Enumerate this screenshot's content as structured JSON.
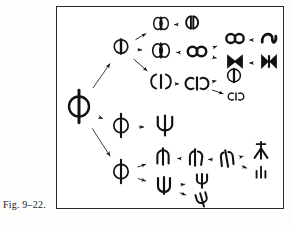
{
  "figure": {
    "caption": "Fig. 9–22.",
    "border_color": "#2a2a2a",
    "ink_color": "#121212",
    "background": "#ffffff",
    "box": {
      "x": 56,
      "y": 6,
      "width": 228,
      "height": 203
    }
  },
  "diagram": {
    "type": "branching-lineage-tree",
    "orientation": "left-to-right",
    "nodes": [
      {
        "id": "root",
        "name": "root-parent-form",
        "glyph": "phi-circle-bar",
        "label": "Φ",
        "x": 22,
        "y": 101,
        "size": 25
      },
      {
        "id": "n-top",
        "name": "upper-branch-parent",
        "glyph": "circle-vertical-bar",
        "label": "Ⓘ",
        "x": 64,
        "y": 41,
        "size": 17
      },
      {
        "id": "n-top-a1",
        "name": "upper-a-stage-1",
        "glyph": "double-lobe-capsule",
        "label": "◑◐",
        "x": 104,
        "y": 18,
        "size": 15
      },
      {
        "id": "n-top-a2",
        "name": "upper-a-stage-2",
        "glyph": "split-lobe-pair",
        "label": "◖◗",
        "x": 135,
        "y": 17,
        "size": 15
      },
      {
        "id": "n-top-b1",
        "name": "upper-b-stage-1",
        "glyph": "double-lobe-capsule",
        "label": "◑◐",
        "x": 104,
        "y": 45,
        "size": 17
      },
      {
        "id": "n-top-b2",
        "name": "upper-b-stage-2",
        "glyph": "double-circle-infinity",
        "label": "∞",
        "x": 140,
        "y": 46,
        "size": 18
      },
      {
        "id": "n-top-b3a",
        "name": "upper-b-branch-upper-infinity",
        "glyph": "double-circle-infinity",
        "label": "∞",
        "x": 178,
        "y": 33,
        "size": 17
      },
      {
        "id": "n-top-b3a2",
        "name": "upper-b-branch-upper-hook",
        "glyph": "s-hook-curve",
        "label": "ʅ",
        "x": 212,
        "y": 33,
        "size": 17
      },
      {
        "id": "n-top-b3b",
        "name": "upper-b-branch-lower-bowtie",
        "glyph": "bowtie",
        "label": "⋈",
        "x": 178,
        "y": 56,
        "size": 17
      },
      {
        "id": "n-top-b3b2",
        "name": "upper-b-branch-lower-bowtie-barred",
        "glyph": "bowtie-with-bar",
        "label": "⋈|",
        "x": 212,
        "y": 56,
        "size": 17
      },
      {
        "id": "n-top-c1",
        "name": "upper-c-stage-1",
        "glyph": "paren-bar-paren",
        "label": "(|)",
        "x": 104,
        "y": 76,
        "size": 16
      },
      {
        "id": "n-top-c2",
        "name": "upper-c-stage-2",
        "glyph": "c-bar-reversed-c",
        "label": "c|ɔ",
        "x": 140,
        "y": 78,
        "size": 16
      },
      {
        "id": "n-top-c3a",
        "name": "upper-c-branch-upper-circle-bar",
        "glyph": "circle-vertical-bar",
        "label": "ɸ",
        "x": 177,
        "y": 70,
        "size": 16
      },
      {
        "id": "n-top-c3b",
        "name": "upper-c-branch-lower-cic",
        "glyph": "c-i-reversed-c",
        "label": "cIƆ",
        "x": 179,
        "y": 91,
        "size": 11
      },
      {
        "id": "n-mid",
        "name": "middle-branch-parent",
        "glyph": "phi-circle-bar",
        "label": "Φ",
        "x": 64,
        "y": 120,
        "size": 18
      },
      {
        "id": "n-mid-2",
        "name": "middle-branch-psi",
        "glyph": "psi-trident",
        "label": "Ψ",
        "x": 108,
        "y": 120,
        "size": 19
      },
      {
        "id": "n-bot",
        "name": "lower-branch-parent",
        "glyph": "phi-circle-bar",
        "label": "Φ",
        "x": 64,
        "y": 166,
        "size": 18
      },
      {
        "id": "n-bot-a1",
        "name": "lower-a-stage-1",
        "glyph": "arch-with-bar",
        "label": "ɸ̄",
        "x": 106,
        "y": 151,
        "size": 16
      },
      {
        "id": "n-bot-a2",
        "name": "lower-a-stage-2",
        "glyph": "arch-splitting",
        "label": "ɗʱ",
        "x": 139,
        "y": 152,
        "size": 16
      },
      {
        "id": "n-bot-a3",
        "name": "lower-a-stage-3",
        "glyph": "arch-separated",
        "label": "ʃʅ",
        "x": 170,
        "y": 153,
        "size": 16
      },
      {
        "id": "n-bot-a4a",
        "name": "lower-a-branch-upper-sprout",
        "glyph": "upright-sprout",
        "label": "⋏",
        "x": 204,
        "y": 145,
        "size": 16
      },
      {
        "id": "n-bot-a4b",
        "name": "lower-a-branch-lower-cluster",
        "glyph": "small-cluster",
        "label": "ılı",
        "x": 204,
        "y": 167,
        "size": 13
      },
      {
        "id": "n-bot-b1",
        "name": "lower-b-stage-1",
        "glyph": "cup-with-bar",
        "label": "ψ",
        "x": 107,
        "y": 180,
        "size": 17
      },
      {
        "id": "n-bot-b2a",
        "name": "lower-b-branch-upper-psi",
        "glyph": "psi-small",
        "label": "ψ",
        "x": 145,
        "y": 175,
        "size": 15
      },
      {
        "id": "n-bot-b2b",
        "name": "lower-b-branch-lower-psi-tilted",
        "glyph": "psi-tilted",
        "label": "ψ",
        "x": 145,
        "y": 194,
        "size": 15
      }
    ],
    "arrows": [
      {
        "from": "root",
        "to": "n-top",
        "style": "long"
      },
      {
        "from": "root",
        "to": "n-mid",
        "style": "long"
      },
      {
        "from": "root",
        "to": "n-bot",
        "style": "long"
      },
      {
        "from": "n-top",
        "to": "n-top-a1",
        "style": "short"
      },
      {
        "from": "n-top",
        "to": "n-top-b1",
        "style": "short"
      },
      {
        "from": "n-top",
        "to": "n-top-c1",
        "style": "short"
      },
      {
        "from": "n-top-a1",
        "to": "n-top-a2",
        "style": "short"
      },
      {
        "from": "n-top-b1",
        "to": "n-top-b2",
        "style": "short"
      },
      {
        "from": "n-top-b2",
        "to": "n-top-b3a",
        "style": "short"
      },
      {
        "from": "n-top-b2",
        "to": "n-top-b3b",
        "style": "short"
      },
      {
        "from": "n-top-b3a",
        "to": "n-top-b3a2",
        "style": "short"
      },
      {
        "from": "n-top-b3b",
        "to": "n-top-b3b2",
        "style": "short"
      },
      {
        "from": "n-top-c1",
        "to": "n-top-c2",
        "style": "short"
      },
      {
        "from": "n-top-c2",
        "to": "n-top-c3a",
        "style": "short"
      },
      {
        "from": "n-top-c2",
        "to": "n-top-c3b",
        "style": "short"
      },
      {
        "from": "n-mid",
        "to": "n-mid-2",
        "style": "short"
      },
      {
        "from": "n-bot",
        "to": "n-bot-a1",
        "style": "short"
      },
      {
        "from": "n-bot",
        "to": "n-bot-b1",
        "style": "short"
      },
      {
        "from": "n-bot-a1",
        "to": "n-bot-a2",
        "style": "short"
      },
      {
        "from": "n-bot-a2",
        "to": "n-bot-a3",
        "style": "short"
      },
      {
        "from": "n-bot-a3",
        "to": "n-bot-a4a",
        "style": "short"
      },
      {
        "from": "n-bot-a3",
        "to": "n-bot-a4b",
        "style": "short"
      },
      {
        "from": "n-bot-b1",
        "to": "n-bot-b2a",
        "style": "short"
      },
      {
        "from": "n-bot-b1",
        "to": "n-bot-b2b",
        "style": "short"
      }
    ]
  }
}
